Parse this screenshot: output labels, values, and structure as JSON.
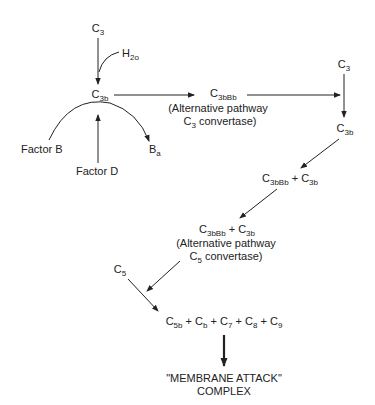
{
  "nodes": {
    "c3_top": {
      "base": "C",
      "sub": "3"
    },
    "h2o": {
      "base": "H",
      "sub": "2o"
    },
    "c3b_left": {
      "base": "C",
      "sub": "3b"
    },
    "factor_b": {
      "text": "Factor B"
    },
    "factor_d": {
      "text": "Factor D"
    },
    "ba": {
      "base": "B",
      "sub": "a"
    },
    "c3bbb": {
      "base": "C",
      "sub": "3bBb"
    },
    "c3_conv_line1": {
      "text": "(Alternative pathway"
    },
    "c3_conv_line2_base": "C",
    "c3_conv_line2_sub": "3",
    "c3_conv_line2_rest": " convertase)",
    "c3_right": {
      "base": "C",
      "sub": "3"
    },
    "c3b_right": {
      "base": "C",
      "sub": "3b"
    },
    "complex1": {
      "a_base": "C",
      "a_sub": "3bBb",
      "plus": " + ",
      "b_base": "C",
      "b_sub": "3b"
    },
    "complex2": {
      "a_base": "C",
      "a_sub": "3bBb",
      "plus": " + ",
      "b_base": "C",
      "b_sub": "3b"
    },
    "c5_conv_line1": {
      "text": "(Alternative pathway"
    },
    "c5_conv_line2_base": "C",
    "c5_conv_line2_sub": "5",
    "c5_conv_line2_rest": " convertase)",
    "c5": {
      "base": "C",
      "sub": "5"
    },
    "terminal": {
      "parts": [
        {
          "base": "C",
          "sub": "5b"
        },
        {
          "base": "C",
          "sub": "b"
        },
        {
          "base": "C",
          "sub": "7"
        },
        {
          "base": "C",
          "sub": "8"
        },
        {
          "base": "C",
          "sub": "9"
        }
      ],
      "plus": " + "
    },
    "mac_line1": "\"MEMBRANE ATTACK\"",
    "mac_line2": "COMPLEX"
  },
  "colors": {
    "line": "#222222",
    "text": "#222222",
    "background": "#ffffff"
  }
}
